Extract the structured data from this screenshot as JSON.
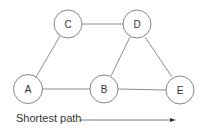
{
  "diagram": {
    "nodes": [
      {
        "id": "C",
        "label": "C",
        "x": 68,
        "y": 24
      },
      {
        "id": "D",
        "label": "D",
        "x": 137,
        "y": 24
      },
      {
        "id": "A",
        "label": "A",
        "x": 28,
        "y": 89
      },
      {
        "id": "B",
        "label": "B",
        "x": 104,
        "y": 89
      },
      {
        "id": "E",
        "label": "E",
        "x": 180,
        "y": 90
      }
    ],
    "edges": [
      [
        "C",
        "D"
      ],
      [
        "C",
        "A"
      ],
      [
        "D",
        "B"
      ],
      [
        "D",
        "E"
      ],
      [
        "A",
        "B"
      ],
      [
        "B",
        "E"
      ]
    ],
    "caption": "Shortest path",
    "colors": {
      "stroke": "#777777",
      "text": "#333333"
    }
  }
}
